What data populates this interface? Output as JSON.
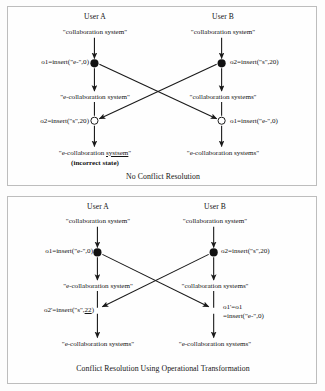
{
  "figure": {
    "type": "diagram"
  },
  "panels": [
    {
      "id": "no-conflict-resolution",
      "caption": "No Conflict Resolution",
      "users": [
        {
          "id": "user-a",
          "label": "User A"
        },
        {
          "id": "user-b",
          "label": "User B"
        }
      ],
      "left": {
        "initial_state": "\"collaboration system\"",
        "op1_label": "o1=insert(\"e-\",0)",
        "mid_state": "\"e-collaboration system\"",
        "op2_label": "o2=insert(\"s\",20)",
        "final_state_prefix": "\"e-collaboration ",
        "final_state_underlined": "systsem",
        "final_state_suffix": "\"",
        "final_note": "(incorrect state)"
      },
      "right": {
        "initial_state": "\"collaboration system\"",
        "op1_label": "o2=insert(\"s\",20)",
        "mid_state": "\"collaboration systems\"",
        "op2_label": "o1=insert(\"e-\",0)",
        "final_state": "\"e-collaboration systems\""
      }
    },
    {
      "id": "operational-transformation",
      "caption": "Conflict Resolution Using Operational Transformation",
      "users": [
        {
          "id": "user-a",
          "label": "User A"
        },
        {
          "id": "user-b",
          "label": "User B"
        }
      ],
      "left": {
        "initial_state": "\"collaboration system\"",
        "op1_label": "o1=insert(\"e-\",0)",
        "mid_state": "\"e-collaboration system\"",
        "op2_prefix": "o2'=insert(\"s\",",
        "op2_underlined": "22",
        "op2_suffix": ")",
        "final_state": "\"e-collaboration systems\""
      },
      "right": {
        "initial_state": "\"collaboration system\"",
        "op1_label": "o2=insert(\"s\",20)",
        "mid_state": "\"collaboration systems\"",
        "op2_line1": "o1'=o1",
        "op2_line2": "=insert(\"e-\",0)",
        "final_state": "\"e-collaboration systems\""
      }
    }
  ],
  "colors": {
    "stroke": "#1a1a1a",
    "panel_border": "#bdbdbd",
    "background": "#fdfdfd",
    "node_fill": "#111111",
    "node_open_fill": "#ffffff"
  }
}
